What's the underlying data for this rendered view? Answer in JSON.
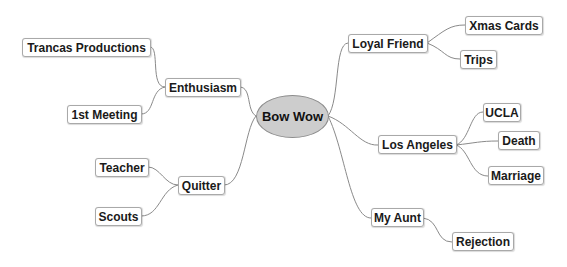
{
  "mindmap": {
    "root": {
      "label": "Bow Wow",
      "fill_color": "#cdcdcd",
      "border_color": "#8c8c8c"
    },
    "branches": [
      {
        "label": "Enthusiasm",
        "side": "left",
        "children": [
          {
            "label": "Trancas Productions"
          },
          {
            "label": "1st Meeting"
          }
        ]
      },
      {
        "label": "Quitter",
        "side": "left",
        "children": [
          {
            "label": "Teacher"
          },
          {
            "label": "Scouts"
          }
        ]
      },
      {
        "label": "Loyal Friend",
        "side": "right",
        "children": [
          {
            "label": "Xmas Cards"
          },
          {
            "label": "Trips"
          }
        ]
      },
      {
        "label": "Los Angeles",
        "side": "right",
        "children": [
          {
            "label": "UCLA"
          },
          {
            "label": "Death"
          },
          {
            "label": "Marriage"
          }
        ]
      },
      {
        "label": "My Aunt",
        "side": "right",
        "children": [
          {
            "label": "Rejection"
          }
        ]
      }
    ],
    "connector_color": "#8a8a8a",
    "node_border_color": "#a9a9a9"
  }
}
